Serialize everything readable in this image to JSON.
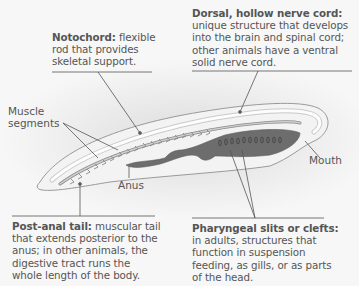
{
  "diagram": {
    "colors": {
      "background": "#f6f6f6",
      "body_fill": "#f2f2f2",
      "outline": "#9a9a9a",
      "digestive_tract": "#6d6d6d",
      "text": "#555555",
      "leader_line": "#555555"
    },
    "callouts": {
      "notochord": {
        "term": "Notochord:",
        "description": "flexible rod that provides skeletal support."
      },
      "nerve_cord": {
        "term": "Dorsal, hollow nerve cord:",
        "description": "unique structure that develops into the brain and spinal cord; other animals have a ventral solid nerve cord."
      },
      "post_anal_tail": {
        "term": "Post-anal tail:",
        "description": "muscular tail that extends posterior to the anus; in other animals, the digestive tract runs the whole length of the body."
      },
      "pharyngeal_slits": {
        "term": "Pharyngeal slits or clefts:",
        "description": "in adults, structures that function in suspension feeding, as gills, or as parts of the head."
      }
    },
    "labels": {
      "muscle_segments": "Muscle segments",
      "anus": "Anus",
      "mouth": "Mouth"
    }
  }
}
